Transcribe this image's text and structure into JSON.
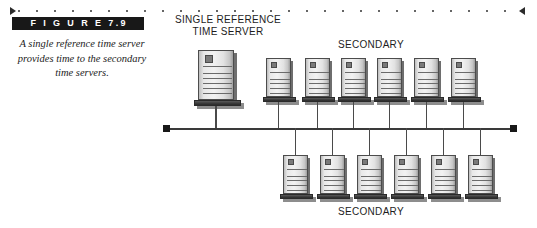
{
  "figure": {
    "banner_label": "F I G U R E   7.9",
    "caption": "A single reference time server provides time to the secondary time servers."
  },
  "diagram": {
    "primary_label": "SINGLE REFERENCE\nTIME SERVER",
    "primary_label_line1": "SINGLE REFERENCE",
    "primary_label_line2": "TIME SERVER",
    "secondary_label_top": "SECONDARY",
    "secondary_label_bottom": "SECONDARY",
    "primary_server": {
      "name": "single-reference-time-server",
      "x": 198,
      "y": 50,
      "width": 36,
      "height": 58
    },
    "secondary_top_servers": [
      {
        "name": "secondary-server-top-1",
        "x": 266,
        "y": 58,
        "width": 25,
        "height": 45
      },
      {
        "name": "secondary-server-top-2",
        "x": 305,
        "y": 58,
        "width": 25,
        "height": 45
      },
      {
        "name": "secondary-server-top-3",
        "x": 341,
        "y": 58,
        "width": 25,
        "height": 45
      },
      {
        "name": "secondary-server-top-4",
        "x": 377,
        "y": 58,
        "width": 25,
        "height": 45
      },
      {
        "name": "secondary-server-top-5",
        "x": 414,
        "y": 58,
        "width": 25,
        "height": 45
      },
      {
        "name": "secondary-server-top-6",
        "x": 451,
        "y": 58,
        "width": 25,
        "height": 45
      }
    ],
    "secondary_bottom_servers": [
      {
        "name": "secondary-server-bottom-1",
        "x": 283,
        "y": 155,
        "width": 25,
        "height": 45
      },
      {
        "name": "secondary-server-bottom-2",
        "x": 320,
        "y": 155,
        "width": 25,
        "height": 45
      },
      {
        "name": "secondary-server-bottom-3",
        "x": 357,
        "y": 155,
        "width": 25,
        "height": 45
      },
      {
        "name": "secondary-server-bottom-4",
        "x": 394,
        "y": 155,
        "width": 25,
        "height": 45
      },
      {
        "name": "secondary-server-bottom-5",
        "x": 431,
        "y": 155,
        "width": 25,
        "height": 45
      },
      {
        "name": "secondary-server-bottom-6",
        "x": 468,
        "y": 155,
        "width": 25,
        "height": 45
      }
    ],
    "bus": {
      "name": "network-bus",
      "x": 165,
      "y": 128,
      "width": 350,
      "terminator_color": "#181818",
      "line_color": "#3a3a3a"
    }
  },
  "colors": {
    "banner_background": "#181818",
    "banner_text": "#ffffff",
    "caption_text": "#1c1c1c",
    "label_text": "#1d1d1d",
    "page_background": "#ffffff",
    "rule_dots": "#666666",
    "rule_arrow": "#2b2b2b"
  }
}
